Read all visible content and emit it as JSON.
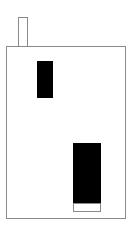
{
  "drawing": {
    "subject": "house",
    "colors": {
      "outline": "#8a8a8a",
      "fill": "#000000",
      "background": "#ffffff"
    },
    "parts": [
      "chimney",
      "house-body",
      "window",
      "door",
      "door-step"
    ]
  }
}
